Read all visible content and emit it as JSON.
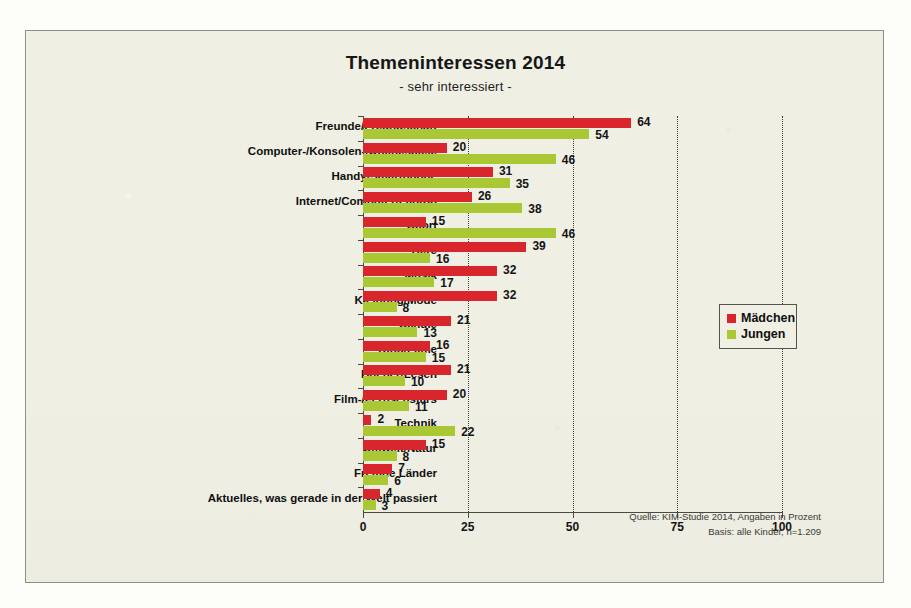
{
  "chart_data": {
    "type": "bar",
    "orientation": "horizontal",
    "title": "Themeninteressen 2014",
    "subtitle": "- sehr interessiert -",
    "xlabel": "",
    "ylabel": "",
    "xlim": [
      0,
      100
    ],
    "xticks": [
      "0",
      "25",
      "50",
      "75",
      "100"
    ],
    "grid": "vertical-dotted",
    "legend_position": "right",
    "categories": [
      "Freunde/Freundschaft",
      "Computer-/Konsolen-/Onlinespiele",
      "Handy/Smartphone",
      "Internet/Computer/Laptop",
      "Sport",
      "Tiere",
      "Musik",
      "Kleidung/Mode",
      "Schule",
      "Kino/Filme",
      "Bücher/Lesen",
      "Film-/Fernsehstars",
      "Technik",
      "Umwelt/Natur",
      "Fremde Länder",
      "Aktuelles, was gerade in der Welt passiert"
    ],
    "series": [
      {
        "name": "Mädchen",
        "color": "#d9262c",
        "values": [
          64,
          20,
          31,
          26,
          15,
          39,
          32,
          32,
          21,
          16,
          21,
          20,
          2,
          15,
          7,
          4
        ]
      },
      {
        "name": "Jungen",
        "color": "#aac734",
        "values": [
          54,
          46,
          35,
          38,
          46,
          16,
          17,
          8,
          13,
          15,
          10,
          11,
          22,
          8,
          6,
          3
        ]
      }
    ],
    "annotations": {
      "source_line1": "Quelle: KIM-Studie 2014, Angaben in Prozent",
      "source_line2": "Basis: alle Kinder, n=1.209"
    }
  },
  "legend": {
    "items": [
      {
        "label": "Mädchen",
        "color": "#d9262c",
        "swatch": "red"
      },
      {
        "label": "Jungen",
        "color": "#aac734",
        "swatch": "green"
      }
    ]
  },
  "colors": {
    "maedchen": "#d9262c",
    "jungen": "#aac734",
    "paper": "#efefe4",
    "axis": "#4a4a42",
    "text": "#101010"
  }
}
